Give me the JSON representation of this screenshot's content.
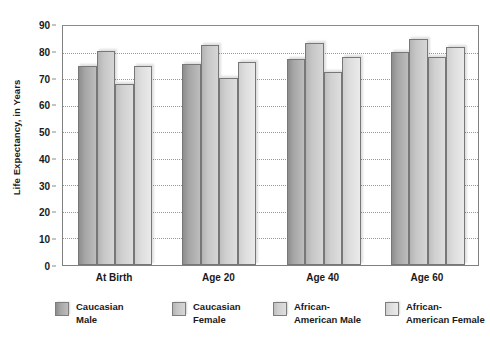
{
  "chart_data": {
    "type": "bar",
    "title": "",
    "xlabel": "",
    "ylabel": "Life Expectancy, in Years",
    "ylim": [
      0,
      90
    ],
    "ytick_step": 10,
    "yticks": [
      "0",
      "10",
      "20",
      "30",
      "40",
      "50",
      "60",
      "70",
      "80",
      "90"
    ],
    "grid": true,
    "legend_position": "bottom",
    "categories": [
      "At Birth",
      "Age 20",
      "Age 40",
      "Age 60"
    ],
    "series": [
      {
        "name": "Caucasian Male",
        "legend_label": "Caucasian\nMale",
        "values": [
          74.5,
          75,
          77,
          79.5
        ]
      },
      {
        "name": "Caucasian Female",
        "legend_label": "Caucasian\nFemale",
        "values": [
          80,
          82,
          83,
          84.5
        ]
      },
      {
        "name": "African-American Male",
        "legend_label": "African-\nAmerican Male",
        "values": [
          67.5,
          70,
          72,
          77.5
        ]
      },
      {
        "name": "African-American Female",
        "legend_label": "African-\nAmerican Female",
        "values": [
          74.5,
          76,
          77.5,
          81.5
        ]
      }
    ]
  },
  "legend": {
    "items": [
      {
        "label": "Caucasian\nMale",
        "left": 0
      },
      {
        "label": "Caucasian\nFemale",
        "left": 117
      },
      {
        "label": "African-\nAmerican Male",
        "left": 218
      },
      {
        "label": "African-\nAmerican Female",
        "left": 330
      }
    ]
  }
}
